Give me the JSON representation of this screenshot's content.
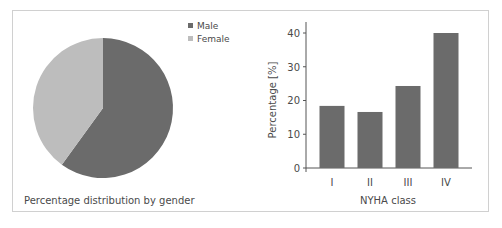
{
  "chart_data": [
    {
      "type": "pie",
      "title": "Percentage distribution by gender",
      "categories": [
        "Male",
        "Female"
      ],
      "values": [
        60,
        40
      ],
      "colors": [
        "#6b6b6b",
        "#bdbdbd"
      ],
      "legend_position": "top-right"
    },
    {
      "type": "bar",
      "title": "",
      "categories": [
        "I",
        "II",
        "III",
        "IV"
      ],
      "values": [
        18.4,
        16.6,
        24.3,
        40.0
      ],
      "xlabel": "NYHA class",
      "ylabel": "Percentage [%]",
      "ylim": [
        0,
        40
      ],
      "yticks": [
        0,
        10,
        20,
        30,
        40
      ],
      "grid": false,
      "color": "#6b6b6b"
    }
  ],
  "labels": {
    "pie_caption": "Percentage distribution by gender",
    "legend_male": "Male",
    "legend_female": "Female",
    "bar_xlabel": "NYHA class",
    "bar_ylabel": "Percentage [%]",
    "ytick_0": "0",
    "ytick_10": "10",
    "ytick_20": "20",
    "ytick_30": "30",
    "ytick_40": "40",
    "cat_1": "I",
    "cat_2": "II",
    "cat_3": "III",
    "cat_4": "IV"
  }
}
